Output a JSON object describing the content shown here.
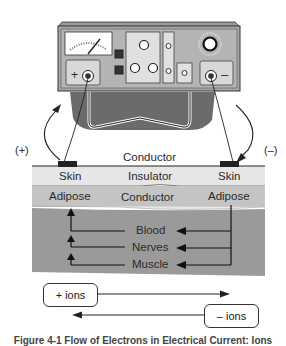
{
  "device": {
    "positive_terminal_label": "+",
    "negative_terminal_label": "–"
  },
  "polarity": {
    "left": "(+)",
    "right": "(–)"
  },
  "layers": {
    "surface_label": "Conductor",
    "skin": {
      "left": "Skin",
      "center": "Insulator",
      "right": "Skin"
    },
    "adipose": {
      "left": "Adipose",
      "center": "Conductor",
      "right": "Adipose"
    },
    "deep": [
      "Blood",
      "Nerves",
      "Muscle"
    ]
  },
  "ions": {
    "positive": "+ ions",
    "negative": "– ions"
  },
  "caption": "Figure 4-1 Flow of Electrons in Electrical Current: Ions"
}
